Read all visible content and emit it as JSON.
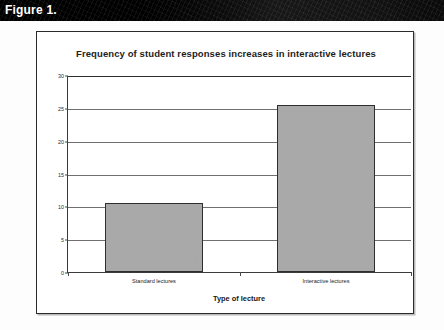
{
  "figure": {
    "label": "Figure 1."
  },
  "chart_data": {
    "type": "bar",
    "title": "Frequency of student responses increases in interactive lectures",
    "xlabel": "Type of lecture",
    "ylabel": "average # of responses/day",
    "categories": [
      "Standard lectures",
      "Interactive lectures"
    ],
    "values": [
      10.5,
      25.5
    ],
    "ylim": [
      0,
      30
    ],
    "yticks": [
      0,
      5,
      10,
      15,
      20,
      25,
      30
    ],
    "ytick_labels": [
      "0",
      "5",
      "10",
      "15",
      "20",
      "25",
      "30"
    ],
    "grid": true,
    "legend": false,
    "bar_color": "#a9a9a9",
    "bar_border_color": "#2e2e2e",
    "gridline_color": "#6f6f6f",
    "axis_color": "#3a3a3a"
  }
}
